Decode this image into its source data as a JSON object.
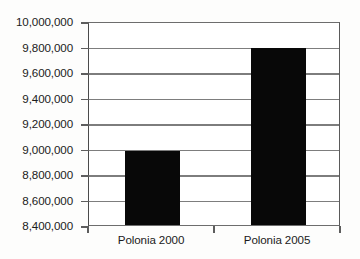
{
  "chart_data": {
    "type": "bar",
    "title": "",
    "subtitle": "",
    "xlabel": "",
    "ylabel": "",
    "categories": [
      "Polonia 2000",
      "Polonia 2005"
    ],
    "values": [
      8980000,
      9790000
    ],
    "series": [
      {
        "name": "",
        "values": [
          8980000,
          9790000
        ]
      }
    ],
    "ylim": [
      8400000,
      10000000
    ],
    "ytick_step": 200000,
    "ytick_labels": [
      "10,000,000",
      "9,800,000",
      "9,600,000",
      "9,400,000",
      "9,200,000",
      "9,000,000",
      "8,800,000",
      "8,600,000",
      "8,400,000"
    ],
    "ytick_values": [
      10000000,
      9800000,
      9600000,
      9400000,
      9200000,
      9000000,
      8800000,
      8600000,
      8400000
    ],
    "grid": true,
    "grid_orientation": "horizontal",
    "legend": false,
    "legend_position": "none",
    "bar_color": "#080808",
    "gridline_color": "#7d7d7d",
    "axis_color": "#4a4a4a",
    "background_color": "#ffffff",
    "annotations": []
  }
}
